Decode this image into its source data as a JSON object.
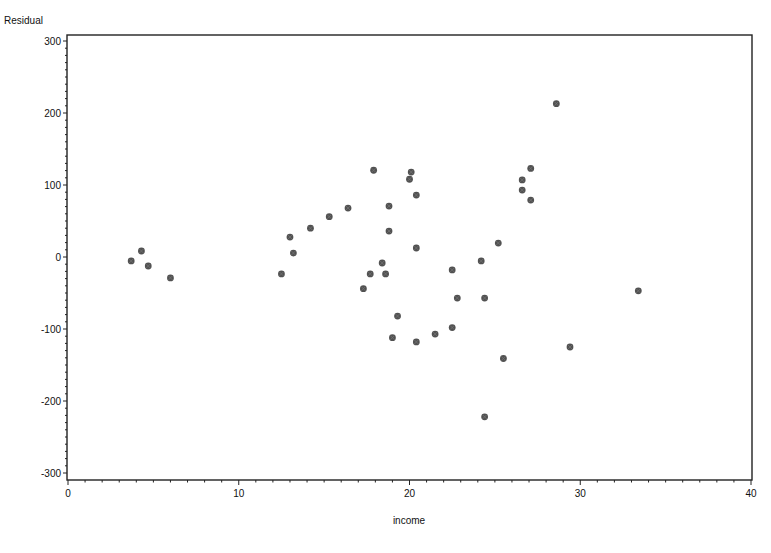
{
  "chart_data": {
    "type": "scatter",
    "title": "",
    "xlabel": "income",
    "ylabel": "Residual",
    "xlim": [
      0,
      40
    ],
    "ylim": [
      -300,
      300
    ],
    "x_ticks": [
      0,
      10,
      20,
      30,
      40
    ],
    "y_ticks": [
      300,
      200,
      100,
      0,
      -100,
      -200,
      -300
    ],
    "x_minor_step": 1,
    "y_minor_step": 10,
    "grid": false,
    "legend": null,
    "marker_color": "#333333",
    "series": [
      {
        "name": "Residual",
        "points": [
          {
            "x": 3.7,
            "y": -5.5
          },
          {
            "x": 4.3,
            "y": 8.3
          },
          {
            "x": 4.7,
            "y": -12.5
          },
          {
            "x": 6.0,
            "y": -29
          },
          {
            "x": 12.5,
            "y": -23.5
          },
          {
            "x": 13.0,
            "y": 27.7
          },
          {
            "x": 13.2,
            "y": 5.5
          },
          {
            "x": 14.2,
            "y": 40
          },
          {
            "x": 15.3,
            "y": 56
          },
          {
            "x": 16.4,
            "y": 68
          },
          {
            "x": 17.3,
            "y": -44
          },
          {
            "x": 17.7,
            "y": -23.5
          },
          {
            "x": 17.9,
            "y": 120.5
          },
          {
            "x": 18.4,
            "y": -8.3
          },
          {
            "x": 18.6,
            "y": -23.5
          },
          {
            "x": 18.8,
            "y": 70.7
          },
          {
            "x": 18.8,
            "y": 36
          },
          {
            "x": 19.0,
            "y": -112
          },
          {
            "x": 19.3,
            "y": -82
          },
          {
            "x": 20.0,
            "y": 108
          },
          {
            "x": 20.1,
            "y": 118
          },
          {
            "x": 20.4,
            "y": -118
          },
          {
            "x": 20.4,
            "y": 12.5
          },
          {
            "x": 20.4,
            "y": 86
          },
          {
            "x": 21.5,
            "y": -107
          },
          {
            "x": 22.5,
            "y": -98
          },
          {
            "x": 22.5,
            "y": -18
          },
          {
            "x": 22.8,
            "y": -57
          },
          {
            "x": 24.2,
            "y": -5.5
          },
          {
            "x": 24.4,
            "y": -57
          },
          {
            "x": 24.4,
            "y": -222
          },
          {
            "x": 25.2,
            "y": 19.4
          },
          {
            "x": 25.5,
            "y": -141
          },
          {
            "x": 26.6,
            "y": 107
          },
          {
            "x": 26.6,
            "y": 93
          },
          {
            "x": 27.1,
            "y": 123
          },
          {
            "x": 27.1,
            "y": 79
          },
          {
            "x": 28.6,
            "y": 213
          },
          {
            "x": 29.4,
            "y": -125
          },
          {
            "x": 33.4,
            "y": -47
          }
        ]
      }
    ]
  },
  "axes": {
    "y_title": "Residual",
    "x_title": "income"
  }
}
